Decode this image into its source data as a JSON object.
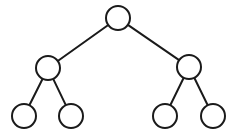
{
  "diagram": {
    "type": "binary-tree",
    "stroke_color": "#1a1a1a",
    "fill_color": "#ffffff",
    "node_radius": 12,
    "nodes": [
      {
        "id": "root",
        "cx": 118,
        "cy": 18,
        "level": 0
      },
      {
        "id": "left",
        "cx": 48,
        "cy": 68,
        "level": 1
      },
      {
        "id": "right",
        "cx": 189,
        "cy": 67,
        "level": 1
      },
      {
        "id": "left-left",
        "cx": 24,
        "cy": 116,
        "level": 2
      },
      {
        "id": "left-right",
        "cx": 71,
        "cy": 116,
        "level": 2
      },
      {
        "id": "right-left",
        "cx": 165,
        "cy": 116,
        "level": 2
      },
      {
        "id": "right-right",
        "cx": 213,
        "cy": 116,
        "level": 2
      }
    ],
    "edges": [
      {
        "from": "root",
        "to": "left"
      },
      {
        "from": "root",
        "to": "right"
      },
      {
        "from": "left",
        "to": "left-left"
      },
      {
        "from": "left",
        "to": "left-right"
      },
      {
        "from": "right",
        "to": "right-left"
      },
      {
        "from": "right",
        "to": "right-right"
      }
    ]
  }
}
